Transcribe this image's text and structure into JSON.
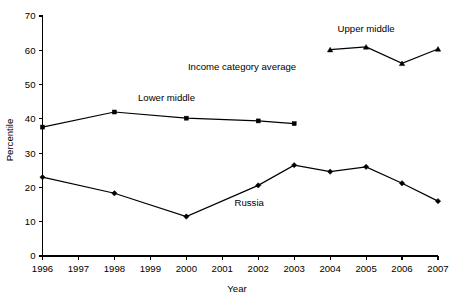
{
  "chart_data": {
    "type": "line",
    "title": "",
    "subtitle": "",
    "xlabel": "Year",
    "ylabel": "Percentile",
    "x": [
      1996,
      1997,
      1998,
      1999,
      2000,
      2001,
      2002,
      2003,
      2004,
      2005,
      2006,
      2007
    ],
    "xtick_labels": [
      "1996",
      "1997",
      "1998",
      "1999",
      "2000",
      "2001",
      "2002",
      "2003",
      "2004",
      "2005",
      "2006",
      "2007"
    ],
    "xlim": [
      1996,
      2007
    ],
    "ytick_labels": [
      "0",
      "10",
      "20",
      "30",
      "40",
      "50",
      "60",
      "70"
    ],
    "yticks": [
      0,
      10,
      20,
      30,
      40,
      50,
      60,
      70
    ],
    "ylim": [
      0,
      70
    ],
    "grid": false,
    "legend_position": "inline-labels",
    "annotations": [
      {
        "text": "Income category average",
        "x": 2001.55,
        "y": 54.2
      }
    ],
    "series": [
      {
        "name": "Russia",
        "marker": "diamond",
        "color": "#000000",
        "label_x": 2001.75,
        "label_y": 14.6,
        "points": [
          {
            "x": 1996,
            "y": 23.0
          },
          {
            "x": 1998,
            "y": 18.3
          },
          {
            "x": 2000,
            "y": 11.5
          },
          {
            "x": 2002,
            "y": 20.6
          },
          {
            "x": 2003,
            "y": 26.5
          },
          {
            "x": 2004,
            "y": 24.6
          },
          {
            "x": 2005,
            "y": 26.0
          },
          {
            "x": 2006,
            "y": 21.2
          },
          {
            "x": 2007,
            "y": 16.0
          }
        ]
      },
      {
        "name": "Lower middle",
        "marker": "square",
        "color": "#000000",
        "label_x": 1999.45,
        "label_y": 45.2,
        "points": [
          {
            "x": 1996,
            "y": 37.6
          },
          {
            "x": 1998,
            "y": 42.0
          },
          {
            "x": 2000,
            "y": 40.2
          },
          {
            "x": 2002,
            "y": 39.4
          },
          {
            "x": 2003,
            "y": 38.6
          }
        ]
      },
      {
        "name": "Upper middle",
        "marker": "triangle",
        "color": "#000000",
        "label_x": 2005.0,
        "label_y": 65.2,
        "points": [
          {
            "x": 2004,
            "y": 60.2
          },
          {
            "x": 2005,
            "y": 61.0
          },
          {
            "x": 2006,
            "y": 56.2
          },
          {
            "x": 2007,
            "y": 60.4
          }
        ]
      }
    ]
  }
}
